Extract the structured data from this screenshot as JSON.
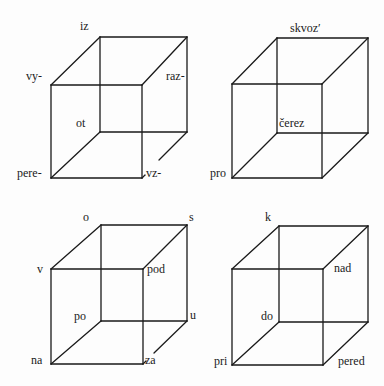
{
  "diagram": {
    "title": "",
    "stroke_color": "#1a1a1a",
    "background": "#fdfdfd",
    "cubes": [
      {
        "id": "cube-1",
        "front": {
          "x1": 51,
          "y1": 85,
          "x2": 142,
          "y2": 178
        },
        "back": {
          "x1": 100,
          "y1": 37,
          "x2": 187,
          "y2": 132
        },
        "broken_edge": {
          "from": [
            187,
            132
          ],
          "to": [
            159,
            160
          ],
          "stub_from": [
            142,
            178
          ],
          "stub_to": [
            145,
            175
          ]
        },
        "labels": [
          {
            "text": "iz",
            "x": 80,
            "y": 20
          },
          {
            "text": "vy-",
            "x": 26,
            "y": 70
          },
          {
            "text": "raz-",
            "x": 166,
            "y": 70
          },
          {
            "text": "ot",
            "x": 76,
            "y": 117
          },
          {
            "text": "pere-",
            "x": 17,
            "y": 167
          },
          {
            "text": "vz-",
            "x": 146,
            "y": 167
          }
        ]
      },
      {
        "id": "cube-2",
        "front": {
          "x1": 232,
          "y1": 84,
          "x2": 322,
          "y2": 178
        },
        "back": {
          "x1": 277,
          "y1": 38,
          "x2": 368,
          "y2": 133
        },
        "broken_edge": null,
        "labels": [
          {
            "text": "skvoz′",
            "x": 290,
            "y": 22
          },
          {
            "text": "čerez",
            "x": 279,
            "y": 117
          },
          {
            "text": "pro",
            "x": 210,
            "y": 167
          }
        ]
      },
      {
        "id": "cube-3",
        "front": {
          "x1": 51,
          "y1": 269,
          "x2": 143,
          "y2": 364
        },
        "back": {
          "x1": 101,
          "y1": 225,
          "x2": 187,
          "y2": 321
        },
        "broken_edge": {
          "from": [
            187,
            321
          ],
          "to": [
            154,
            353
          ],
          "stub_from": [
            143,
            364
          ],
          "stub_to": [
            146,
            361
          ]
        },
        "labels": [
          {
            "text": "o",
            "x": 83,
            "y": 211
          },
          {
            "text": "s",
            "x": 189,
            "y": 211
          },
          {
            "text": "v",
            "x": 37,
            "y": 263
          },
          {
            "text": "pod",
            "x": 147,
            "y": 263
          },
          {
            "text": "po",
            "x": 74,
            "y": 310
          },
          {
            "text": "u",
            "x": 190,
            "y": 309
          },
          {
            "text": "na",
            "x": 31,
            "y": 354
          },
          {
            "text": "za",
            "x": 145,
            "y": 354
          }
        ]
      },
      {
        "id": "cube-4",
        "front": {
          "x1": 232,
          "y1": 269,
          "x2": 323,
          "y2": 365
        },
        "back": {
          "x1": 279,
          "y1": 226,
          "x2": 368,
          "y2": 322
        },
        "broken_edge": null,
        "labels": [
          {
            "text": "k",
            "x": 265,
            "y": 211
          },
          {
            "text": "nad",
            "x": 334,
            "y": 262
          },
          {
            "text": "do",
            "x": 261,
            "y": 310
          },
          {
            "text": "pri",
            "x": 214,
            "y": 355
          },
          {
            "text": "pered",
            "x": 338,
            "y": 355
          }
        ]
      }
    ]
  }
}
